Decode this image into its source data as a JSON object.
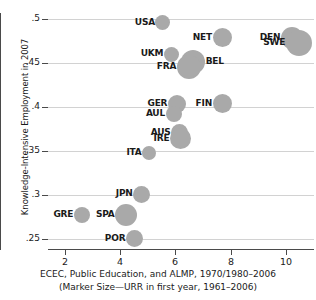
{
  "chart_data": {
    "type": "scatter",
    "title": "",
    "xlabel": "ECEC, Public Education, and ALMP, 1970/1980–2006",
    "xlabel_sub": "(Marker Size—URR in first year, 1961–2006)",
    "ylabel": "Knowledge-Intensive Employment in 2007",
    "xlim": [
      1.4,
      11.0
    ],
    "ylim": [
      0.2375,
      0.5065
    ],
    "xticks": [
      2,
      4,
      6,
      8,
      10
    ],
    "xtick_labels": [
      "2",
      "4",
      "6",
      "8",
      "10"
    ],
    "yticks": [
      0.25,
      0.3,
      0.35,
      0.4,
      0.45,
      0.5
    ],
    "ytick_labels": [
      ".25",
      ".3",
      ".35",
      ".4",
      ".45",
      ".5"
    ],
    "grid": "horizontal",
    "legend": "none",
    "marker_color": "#a9a9a9",
    "size_encoding": "Marker size = URR in first year, 1961–2006",
    "points": [
      {
        "label": "USA",
        "x": 5.55,
        "y": 0.4955,
        "size": 15,
        "label_pos": "left"
      },
      {
        "label": "NET",
        "x": 7.68,
        "y": 0.4785,
        "size": 19,
        "label_pos": "left"
      },
      {
        "label": "DEN",
        "x": 10.2,
        "y": 0.4785,
        "size": 22,
        "label_pos": "left"
      },
      {
        "label": "SWE",
        "x": 10.45,
        "y": 0.4725,
        "size": 26,
        "label_pos": "left"
      },
      {
        "label": "UKM",
        "x": 5.85,
        "y": 0.4595,
        "size": 15,
        "label_pos": "left"
      },
      {
        "label": "BEL",
        "x": 6.62,
        "y": 0.4505,
        "size": 24,
        "label_pos": "right"
      },
      {
        "label": "FRA",
        "x": 6.48,
        "y": 0.4455,
        "size": 24,
        "label_pos": "left"
      },
      {
        "label": "GER",
        "x": 6.05,
        "y": 0.4035,
        "size": 18,
        "label_pos": "left"
      },
      {
        "label": "FIN",
        "x": 7.68,
        "y": 0.4035,
        "size": 19,
        "label_pos": "left"
      },
      {
        "label": "AUL",
        "x": 5.93,
        "y": 0.3915,
        "size": 16,
        "label_pos": "left"
      },
      {
        "label": "AUS",
        "x": 6.15,
        "y": 0.3705,
        "size": 17,
        "label_pos": "left"
      },
      {
        "label": "IRE",
        "x": 6.18,
        "y": 0.3635,
        "size": 21,
        "label_pos": "left"
      },
      {
        "label": "ITA",
        "x": 5.05,
        "y": 0.3475,
        "size": 14,
        "label_pos": "left"
      },
      {
        "label": "JPN",
        "x": 4.78,
        "y": 0.3005,
        "size": 17,
        "label_pos": "left"
      },
      {
        "label": "GRE",
        "x": 2.62,
        "y": 0.2775,
        "size": 16,
        "label_pos": "left"
      },
      {
        "label": "SPA",
        "x": 4.22,
        "y": 0.2775,
        "size": 22,
        "label_pos": "left"
      },
      {
        "label": "POR",
        "x": 4.52,
        "y": 0.2505,
        "size": 17,
        "label_pos": "left"
      }
    ]
  }
}
